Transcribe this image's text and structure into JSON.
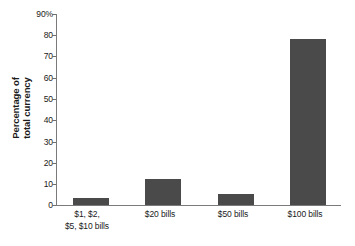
{
  "chart_data": {
    "type": "bar",
    "title": "",
    "xlabel": "",
    "ylabel_line1": "Percentage of",
    "ylabel_line2": "total currency",
    "categories": [
      {
        "line1": "$1, $2,",
        "line2": "$5, $10 bills"
      },
      {
        "line1": "$20 bills",
        "line2": ""
      },
      {
        "line1": "$50 bills",
        "line2": ""
      },
      {
        "line1": "$100 bills",
        "line2": ""
      }
    ],
    "values": [
      3.3,
      12.2,
      5.3,
      78
    ],
    "ylim": [
      0,
      90
    ],
    "ytick_labels": [
      "90%",
      "80",
      "70",
      "60",
      "50",
      "40",
      "30",
      "20",
      "10",
      "0"
    ],
    "ytick_values": [
      90,
      80,
      70,
      60,
      50,
      40,
      30,
      20,
      10,
      0
    ],
    "grid": false,
    "legend": "none",
    "bar_color": "#4a4a4a",
    "axis_color": "#7a7a7a",
    "background": "#ffffff"
  }
}
